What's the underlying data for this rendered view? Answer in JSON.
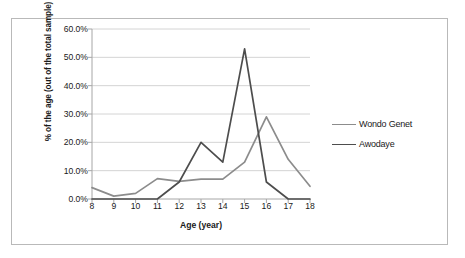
{
  "chart_data": {
    "type": "line",
    "title": "",
    "xlabel": "Age (year)",
    "ylabel": "% of the age (out of the total sample)",
    "categories": [
      8,
      9,
      10,
      11,
      12,
      13,
      14,
      15,
      16,
      17,
      18
    ],
    "x_tick_labels": [
      "8",
      "9",
      "10",
      "11",
      "12",
      "13",
      "14",
      "15",
      "16",
      "17",
      "18"
    ],
    "y_tick_labels": [
      "0.0%",
      "10.0%",
      "20.0%",
      "30.0%",
      "40.0%",
      "50.0%",
      "60.0%"
    ],
    "y_tick_values": [
      0,
      10,
      20,
      30,
      40,
      50,
      60
    ],
    "ylim": [
      0,
      60
    ],
    "xlim": [
      8,
      18
    ],
    "grid": "horizontal",
    "legend_position": "right",
    "series": [
      {
        "name": "Wondo Genet",
        "color": "#8c8c8c",
        "values": [
          4.0,
          1.0,
          2.0,
          7.2,
          6.2,
          7.0,
          7.0,
          13.0,
          29.0,
          14.0,
          4.5
        ]
      },
      {
        "name": "Awodaye",
        "color": "#4d4d4d",
        "values": [
          0.0,
          0.0,
          0.0,
          0.0,
          6.0,
          20.0,
          13.0,
          53.0,
          6.0,
          0.0,
          0.0
        ]
      }
    ]
  },
  "axes": {
    "x_title": "Age (year)",
    "y_title": "% of the age (out of the total sample)"
  },
  "legend": {
    "items": [
      {
        "label": "Wondo Genet"
      },
      {
        "label": "Awodaye"
      }
    ]
  },
  "colors": {
    "series_wondo_genet": "#8c8c8c",
    "series_awodaye": "#4d4d4d",
    "gridline": "#d4d4d4",
    "axis": "#a6a6a6",
    "frame_border": "#b9b9b9",
    "text": "#1a1a1a",
    "background": "#ffffff"
  }
}
